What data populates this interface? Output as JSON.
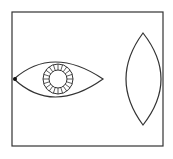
{
  "diagram": {
    "colors": {
      "stroke": "#333333",
      "background": "#ffffff",
      "pupil_dot": "#111111"
    },
    "frame": {
      "x": 12,
      "y": 12,
      "width": 151,
      "height": 134
    },
    "eye": {
      "left_tip": [
        14,
        79
      ],
      "right_tip": [
        103,
        79
      ],
      "top_y": 62,
      "bottom_y": 97,
      "iris": {
        "cx": 58,
        "cy": 79,
        "outer_r": 15,
        "inner_r": 9,
        "spokes": 20
      }
    },
    "lens": {
      "top": [
        143,
        33
      ],
      "bottom": [
        143,
        125
      ],
      "left_x": 126,
      "right_x": 161
    }
  }
}
